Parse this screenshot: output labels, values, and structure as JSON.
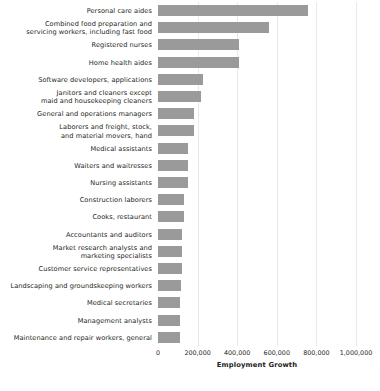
{
  "chart_data": {
    "type": "bar",
    "orientation": "horizontal",
    "title": "",
    "xlabel": "Employment Growth",
    "ylabel": "",
    "xlim": [
      0,
      1000000
    ],
    "xticks": [
      0,
      200000,
      400000,
      600000,
      800000,
      1000000
    ],
    "xticklabels": [
      "0",
      "200,000",
      "400,000",
      "600,000",
      "800,000",
      "1,000,000"
    ],
    "grid": true,
    "grid_axis": "x",
    "legend": false,
    "bar_color": "#9a9a9a",
    "background_color": "#ffffff",
    "categories": [
      "Personal care aides",
      "Combined food preparation and\nservicing workers, including fast food",
      "Registered nurses",
      "Home health aides",
      "Software developers, applications",
      "Janitors and cleaners except\nmaid and housekeeping cleaners",
      "General and operations managers",
      "Laborers and freight, stock,\nand material movers, hand",
      "Medical assistants",
      "Waiters and waitresses",
      "Nursing assistants",
      "Construction laborers",
      "Cooks, restaurant",
      "Accountants and auditors",
      "Market research analysts and\nmarketing specialists",
      "Customer service representatives",
      "Landscaping and groundskeeping workers",
      "Medical secretaries",
      "Management analysts",
      "Maintenance and repair workers, general"
    ],
    "values": [
      758000,
      560000,
      410000,
      410000,
      228000,
      218000,
      182000,
      182000,
      152000,
      152000,
      152000,
      132000,
      132000,
      122000,
      122000,
      122000,
      117000,
      112000,
      112000,
      110000
    ]
  }
}
